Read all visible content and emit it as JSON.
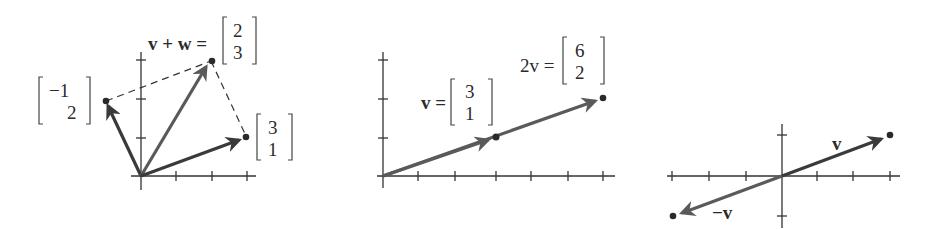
{
  "figures": [
    {
      "id": "sum",
      "title": "Vector addition (parallelogram)",
      "label_sum_lhs": "v + w =",
      "sum_top": "2",
      "sum_bottom": "3",
      "w_top": "−1",
      "w_bottom": "2",
      "v_top": "3",
      "v_bottom": "1"
    },
    {
      "id": "scale",
      "title": "Scalar multiple 2v",
      "label_2v_lhs": "2v =",
      "twov_top": "6",
      "twov_bottom": "2",
      "label_v_lhs": "v =",
      "v_top": "3",
      "v_bottom": "1"
    },
    {
      "id": "negation",
      "title": "Vector and its negative",
      "label_v": "v",
      "label_neg_v": "−v"
    }
  ],
  "colors": {
    "ink": "#2a2a2a",
    "vector_dark": "#3a3a3a",
    "vector_mid": "#5a5a5a",
    "axis": "#333333"
  }
}
